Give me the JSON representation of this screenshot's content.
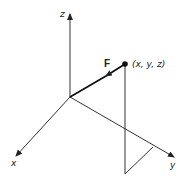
{
  "diagram": {
    "title": "",
    "axes": {
      "x": {
        "label": "x"
      },
      "y": {
        "label": "y"
      },
      "z": {
        "label": "z"
      }
    },
    "point": {
      "label": "(x, y, z)"
    },
    "force": {
      "label": "F"
    },
    "colors": {
      "line": "#333333",
      "background": "#ffffff"
    }
  }
}
